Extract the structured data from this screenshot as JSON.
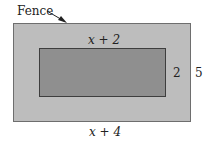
{
  "diagram": {
    "fence_label": "Fence",
    "inner_width_label": "x + 2",
    "inner_height_label": "2",
    "outer_height_label": "5",
    "outer_width_label": "x + 4",
    "colors": {
      "outer_fill": "#bdbdbd",
      "inner_fill": "#8f8f8f",
      "background": "#ffffff"
    }
  }
}
